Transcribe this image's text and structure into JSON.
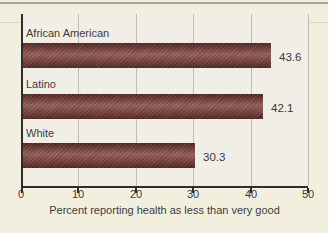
{
  "figure": {
    "background_color": "#f3efdf",
    "plot_background_color": "#f1efe5",
    "gridline_color": "#bdbdb0",
    "axis_color": "#2d2d2d",
    "text_color": "#3b3b3b",
    "bar_color_dark": "#4f2926",
    "bar_color_light": "#976159",
    "top_rule_color": "#a6a698"
  },
  "chart_data": {
    "type": "bar",
    "orientation": "horizontal",
    "title": "",
    "categories": [
      "African American",
      "Latino",
      "White"
    ],
    "values": [
      43.6,
      42.1,
      30.3
    ],
    "value_labels": [
      "43.6",
      "42.1",
      "30.3"
    ],
    "xlabel": "Percent reporting health as less than very good",
    "ylabel": "",
    "xlim": [
      0,
      50
    ],
    "xticks": [
      0,
      10,
      20,
      30,
      40,
      50
    ],
    "xtick_labels": [
      "0",
      "10",
      "20",
      "30",
      "40",
      "50"
    ],
    "grid": "vertical",
    "legend": "none"
  }
}
